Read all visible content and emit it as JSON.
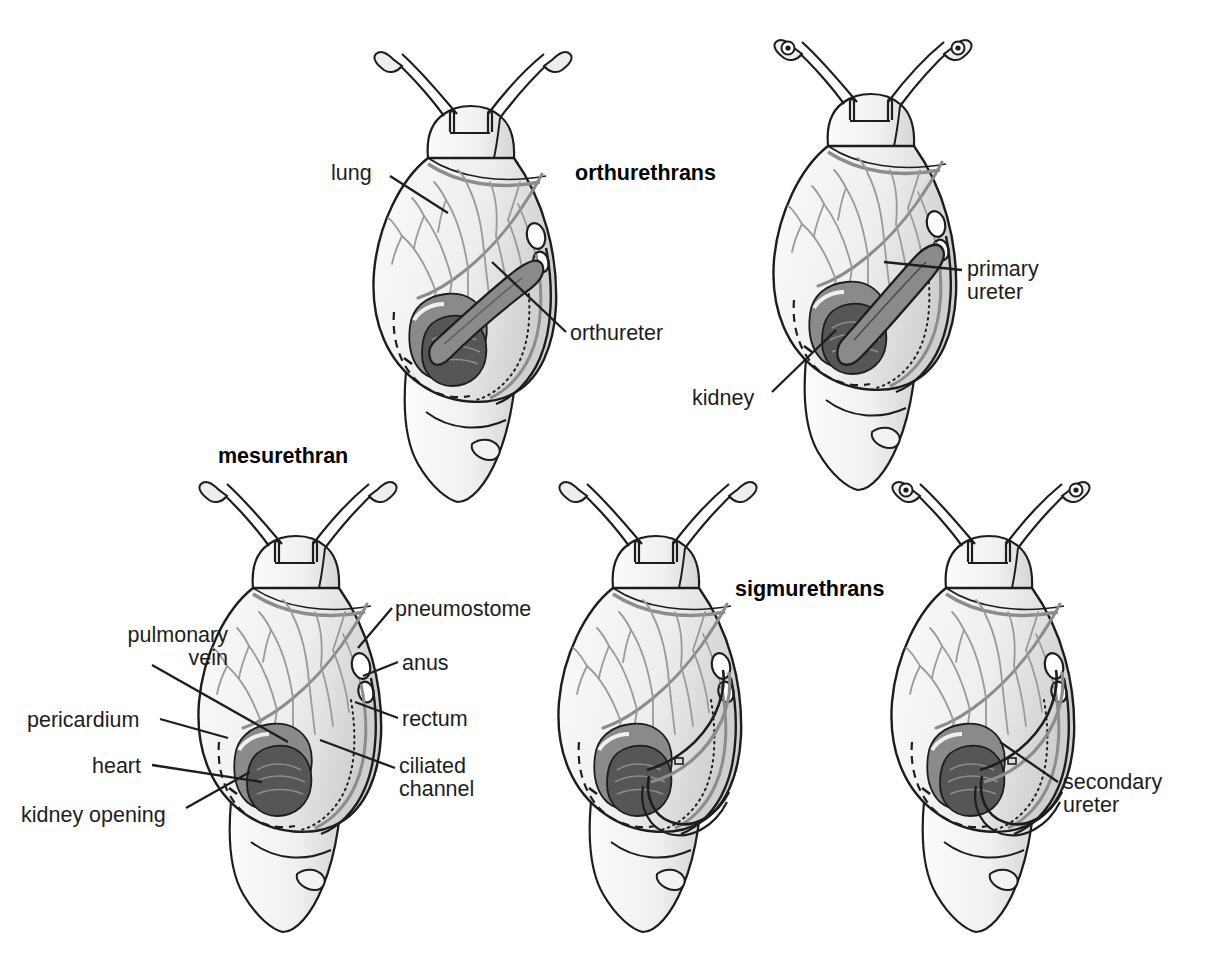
{
  "figure": {
    "background": "#ffffff",
    "palette": {
      "outline": "#1d1d1b",
      "body_fill": "#f2f2f2",
      "mantle_fill": "#e6e6e6",
      "lung_vein": "#8c8c8c",
      "kidney_dark": "#595959",
      "pericardium_mid": "#8a8a8a",
      "ureter_mid": "#7a7a7a",
      "label_text": "#1d1d1b"
    }
  },
  "headings": [
    {
      "id": "orthurethrans",
      "text": "orthurethrans",
      "x": 575,
      "y": 161
    },
    {
      "id": "mesurethran",
      "text": "mesurethran",
      "x": 218,
      "y": 444
    },
    {
      "id": "sigmurethrans",
      "text": "sigmurethrans",
      "x": 735,
      "y": 577
    }
  ],
  "panels": [
    {
      "id": "orthurethran-snail",
      "name": "orthurethran specimen",
      "heading": "orthurethrans",
      "labels": [
        "lung",
        "orthureter"
      ]
    },
    {
      "id": "orthurethran-snail-2",
      "name": "orthurethran specimen with primary ureter",
      "heading": "orthurethrans",
      "labels": [
        "primary ureter",
        "kidney"
      ]
    },
    {
      "id": "mesurethran-snail",
      "name": "mesurethran specimen",
      "heading": "mesurethran",
      "labels": [
        "pulmonary vein",
        "pericardium",
        "heart",
        "kidney opening",
        "pneumostome",
        "anus",
        "rectum",
        "ciliated channel"
      ]
    },
    {
      "id": "sigmurethran-snail-1",
      "name": "sigmurethran specimen left",
      "heading": "sigmurethrans",
      "labels": []
    },
    {
      "id": "sigmurethran-snail-2",
      "name": "sigmurethran specimen right",
      "heading": "sigmurethrans",
      "labels": [
        "secondary ureter"
      ]
    }
  ],
  "labels": [
    {
      "id": "lung",
      "text": "lung",
      "x": 331,
      "y": 162,
      "align": "left",
      "panel": "orthurethran-snail"
    },
    {
      "id": "orthureter",
      "text": "orthureter",
      "x": 570,
      "y": 322,
      "align": "left",
      "panel": "orthurethran-snail"
    },
    {
      "id": "primary-ureter",
      "text": "primary\nureter",
      "x": 967,
      "y": 258,
      "align": "left",
      "panel": "orthurethran-snail-2"
    },
    {
      "id": "kidney",
      "text": "kidney",
      "x": 692,
      "y": 387,
      "align": "left",
      "panel": "orthurethran-snail-2"
    },
    {
      "id": "pulmonary-vein",
      "text": "pulmonary\nvein",
      "x": 56,
      "y": 624,
      "align": "right",
      "panel": "mesurethran-snail",
      "width": 172
    },
    {
      "id": "pericardium",
      "text": "pericardium",
      "x": 27,
      "y": 709,
      "align": "left",
      "panel": "mesurethran-snail"
    },
    {
      "id": "heart",
      "text": "heart",
      "x": 92,
      "y": 755,
      "align": "left",
      "panel": "mesurethran-snail"
    },
    {
      "id": "kidney-opening",
      "text": "kidney opening",
      "x": 21,
      "y": 804,
      "align": "left",
      "panel": "mesurethran-snail"
    },
    {
      "id": "pneumostome",
      "text": "pneumostome",
      "x": 395,
      "y": 598,
      "align": "left",
      "panel": "mesurethran-snail"
    },
    {
      "id": "anus",
      "text": "anus",
      "x": 402,
      "y": 652,
      "align": "left",
      "panel": "mesurethran-snail"
    },
    {
      "id": "rectum",
      "text": "rectum",
      "x": 402,
      "y": 708,
      "align": "left",
      "panel": "mesurethran-snail"
    },
    {
      "id": "ciliated-channel",
      "text": "ciliated\nchannel",
      "x": 399,
      "y": 755,
      "align": "left",
      "panel": "mesurethran-snail"
    },
    {
      "id": "secondary-ureter",
      "text": "secondary\nureter",
      "x": 1063,
      "y": 771,
      "align": "left",
      "panel": "sigmurethran-snail-2"
    }
  ]
}
